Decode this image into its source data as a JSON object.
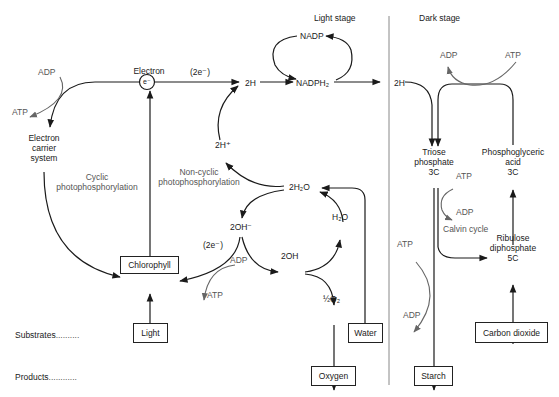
{
  "headings": {
    "light_stage": "Light stage",
    "dark_stage": "Dark stage"
  },
  "row_labels": {
    "substrates": "Substrates",
    "substrates_dots": "..........",
    "products": "Products",
    "products_dots": "............"
  },
  "light_stage": {
    "electron_label": "Electron",
    "electron_symbol": "e⁻",
    "two_e_top": "(2e⁻)",
    "two_h": "2H",
    "nadp": "NADP",
    "nadph2": "NADPH₂",
    "adp_left": "ADP",
    "atp_left": "ATP",
    "electron_carrier": [
      "Electron",
      "carrier",
      "system"
    ],
    "cyclic": [
      "Cyclic",
      "photophosphorylation"
    ],
    "non_cyclic": [
      "Non-cyclic",
      "photophosphorylation"
    ],
    "two_h_plus": "2H⁺",
    "two_h2o": "2H₂O",
    "two_oh_minus": "2OH⁻",
    "h2o": "H₂O",
    "two_e_lower": "(2e⁻)",
    "adp_lower": "ADP",
    "atp_lower": "ATP",
    "two_oh": "2OH",
    "half_o2": "½O₂"
  },
  "dark_stage": {
    "two_h": "2H",
    "adp_top": "ADP",
    "atp_top": "ATP",
    "triose_phosphate": [
      "Triose",
      "phosphate",
      "3C"
    ],
    "phosphoglyceric_acid": [
      "Phosphoglyceric",
      "acid",
      "3C"
    ],
    "atp_mid": "ATP",
    "adp_mid": "ADP",
    "calvin_cycle": "Calvin cycle",
    "ribulose_diphosphate": [
      "Ribulose",
      "diphosphate",
      "5C"
    ],
    "atp_lower": "ATP",
    "adp_lower": "ADP"
  },
  "boxes": {
    "chlorophyll": "Chlorophyll",
    "light": "Light",
    "water": "Water",
    "oxygen": "Oxygen",
    "starch": "Starch",
    "carbon_dioxide": "Carbon dioxide"
  },
  "colors": {
    "line": "#1a1a1a",
    "grey_arrow": "#666666",
    "divider": "#888888"
  }
}
